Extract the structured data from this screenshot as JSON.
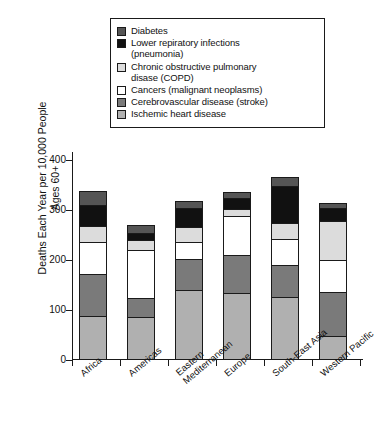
{
  "chart_data": {
    "type": "bar",
    "stacked": true,
    "title": "",
    "xlabel": "",
    "ylabel": "Deaths Each Year per 10,000\nPeople Ages 60+",
    "ylim": [
      0,
      400
    ],
    "yticks": [
      0,
      100,
      200,
      300,
      400
    ],
    "grid": false,
    "legend_position": "top",
    "categories": [
      "Africa",
      "Americas",
      "Eastern\nMediterranean",
      "Europe",
      "South-East Asia",
      "Western Pacific"
    ],
    "series": [
      {
        "name": "Ischemic heart disease",
        "color": "#b0b0b0",
        "values": [
          85,
          82,
          137,
          130,
          123,
          44
        ]
      },
      {
        "name": "Cerebrovascular disease (stroke)",
        "color": "#7a7a7a",
        "values": [
          83,
          38,
          61,
          77,
          64,
          89
        ]
      },
      {
        "name": "Cancers (malignant neoplasms)",
        "color": "#ffffff",
        "values": [
          64,
          96,
          34,
          78,
          51,
          63
        ]
      },
      {
        "name": "Chronic obstructive pulmonary disase (COPD)",
        "color": "#dcdcdc",
        "values": [
          33,
          21,
          31,
          13,
          32,
          79
        ]
      },
      {
        "name": "Lower respiratory infections (pneumonia)",
        "color": "#111111",
        "values": [
          42,
          13,
          37,
          22,
          75,
          25
        ]
      },
      {
        "name": "Diabetes",
        "color": "#555555",
        "values": [
          28,
          17,
          15,
          13,
          17,
          10
        ]
      }
    ],
    "totals": [
      335,
      267,
      315,
      333,
      362,
      310
    ]
  },
  "legend": {
    "items": [
      {
        "label": "Diabetes",
        "color": "#555555"
      },
      {
        "label": "Lower repiratory infections\n(pneumonia)",
        "color": "#111111"
      },
      {
        "label": "Chronic obstructive pulmonary\ndisase (COPD)",
        "color": "#dcdcdc"
      },
      {
        "label": "Cancers (malignant neoplasms)",
        "color": "#ffffff"
      },
      {
        "label": "Cerebrovascular disease (stroke)",
        "color": "#7a7a7a"
      },
      {
        "label": "Ischemic heart disease",
        "color": "#b0b0b0"
      }
    ]
  },
  "axis": {
    "y_label": "Deaths Each Year per 10,000\nPeople Ages 60+",
    "y_ticks": [
      "400",
      "300",
      "200",
      "100",
      "0"
    ]
  }
}
